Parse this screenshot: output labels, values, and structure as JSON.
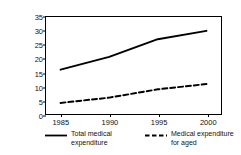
{
  "chart_data": {
    "type": "line",
    "title": "",
    "xlabel": "",
    "ylabel": "Trillion yen",
    "x": [
      1985,
      1990,
      1995,
      2000
    ],
    "xticklabels": [
      "1985",
      "1990",
      "1995",
      "2000"
    ],
    "xlim": [
      1983.5,
      2001.5
    ],
    "ylim": [
      0,
      35
    ],
    "yticks": [
      0,
      5,
      10,
      15,
      20,
      25,
      30,
      35
    ],
    "yticklabels": [
      "0",
      "5",
      "10",
      "15",
      "20",
      "25",
      "30",
      "35"
    ],
    "grid": false,
    "legend_position": "below",
    "series": [
      {
        "name": "Total medical expenditure",
        "style": "solid",
        "color": "#000000",
        "values": [
          16.0,
          20.6,
          27.0,
          30.0
        ]
      },
      {
        "name": "Medical expenditure for aged",
        "style": "dashed",
        "color": "#000000",
        "values": [
          4.0,
          5.9,
          8.9,
          10.8
        ]
      }
    ]
  },
  "axis": {
    "y_label": "Trillion yen"
  },
  "legend": {
    "entries": [
      {
        "label": "Total medical\nexpenditure",
        "style": "solid"
      },
      {
        "label": "Medical expenditure\nfor aged",
        "style": "dashed"
      }
    ]
  }
}
